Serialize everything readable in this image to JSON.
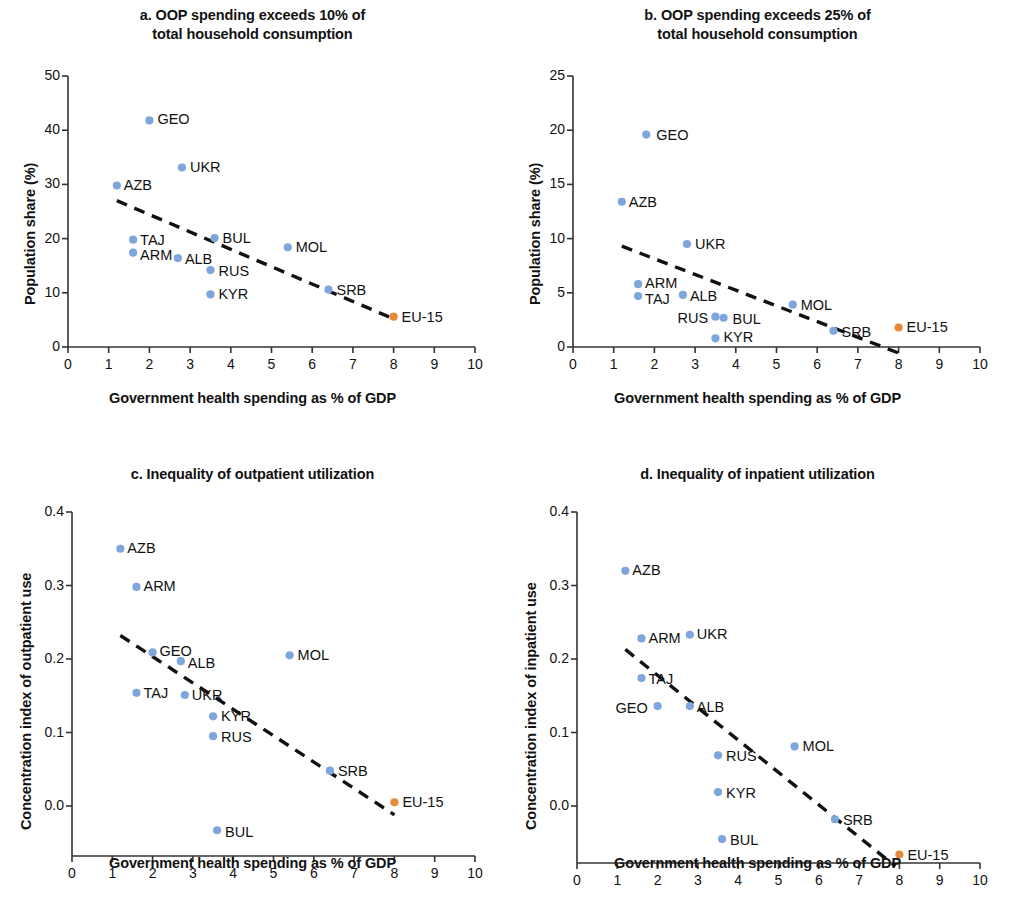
{
  "figure": {
    "axis_label_x": "Government health spending as % of GDP",
    "dot_color_blue": "#7FA6DC",
    "dot_color_orange": "#E8883A",
    "trend_color": "#111111"
  },
  "chart_data": [
    {
      "id": "a",
      "type": "scatter",
      "title_line1": "a. OOP spending exceeds 10% of",
      "title_line2": "total household consumption",
      "xlabel": "Government health spending as % of GDP",
      "ylabel": "Population share (%)",
      "xlim": [
        0,
        10
      ],
      "ylim": [
        0,
        50
      ],
      "xticks": [
        0,
        1,
        2,
        3,
        4,
        5,
        6,
        7,
        8,
        9,
        10
      ],
      "yticks": [
        0,
        10,
        20,
        30,
        40,
        50
      ],
      "grid": false,
      "legend": "none",
      "trendline": {
        "x0": 1.2,
        "y0": 27.0,
        "x1": 8.0,
        "y1": 5.2
      },
      "points": [
        {
          "label": "GEO",
          "x": 2.0,
          "y": 41.8,
          "color": "blue",
          "lx": 8,
          "ly": -8
        },
        {
          "label": "UKR",
          "x": 2.8,
          "y": 33.1,
          "color": "blue",
          "lx": 8,
          "ly": -8
        },
        {
          "label": "AZB",
          "x": 1.2,
          "y": 29.8,
          "color": "blue",
          "lx": 7,
          "ly": -7
        },
        {
          "label": "TAJ",
          "x": 1.6,
          "y": 19.8,
          "color": "blue",
          "lx": 7,
          "ly": -7
        },
        {
          "label": "ARM",
          "x": 1.6,
          "y": 17.4,
          "color": "blue",
          "lx": 7,
          "ly": -5
        },
        {
          "label": "ALB",
          "x": 2.7,
          "y": 16.4,
          "color": "blue",
          "lx": 7,
          "ly": -6
        },
        {
          "label": "BUL",
          "x": 3.6,
          "y": 20.1,
          "color": "blue",
          "lx": 8,
          "ly": -7
        },
        {
          "label": "RUS",
          "x": 3.5,
          "y": 14.2,
          "color": "blue",
          "lx": 8,
          "ly": -6
        },
        {
          "label": "KYR",
          "x": 3.5,
          "y": 9.7,
          "color": "blue",
          "lx": 8,
          "ly": -7
        },
        {
          "label": "MOL",
          "x": 5.4,
          "y": 18.4,
          "color": "blue",
          "lx": 8,
          "ly": -7
        },
        {
          "label": "SRB",
          "x": 6.4,
          "y": 10.6,
          "color": "blue",
          "lx": 8,
          "ly": -7
        },
        {
          "label": "EU-15",
          "x": 8.0,
          "y": 5.6,
          "color": "orange",
          "lx": 8,
          "ly": -7
        }
      ]
    },
    {
      "id": "b",
      "type": "scatter",
      "title_line1": "b. OOP spending exceeds 25% of",
      "title_line2": "total household consumption",
      "xlabel": "Government health spending as % of GDP",
      "ylabel": "Population share (%)",
      "xlim": [
        0,
        10
      ],
      "ylim": [
        0,
        25
      ],
      "xticks": [
        0,
        1,
        2,
        3,
        4,
        5,
        6,
        7,
        8,
        9,
        10
      ],
      "yticks": [
        0,
        5,
        10,
        15,
        20,
        25
      ],
      "grid": false,
      "legend": "none",
      "trendline": {
        "x0": 1.2,
        "y0": 9.3,
        "x1": 8.1,
        "y1": -0.7
      },
      "points": [
        {
          "label": "GEO",
          "x": 1.8,
          "y": 19.6,
          "color": "blue",
          "lx": 10,
          "ly": -7
        },
        {
          "label": "AZB",
          "x": 1.2,
          "y": 13.4,
          "color": "blue",
          "lx": 7,
          "ly": -7
        },
        {
          "label": "UKR",
          "x": 2.8,
          "y": 9.5,
          "color": "blue",
          "lx": 8,
          "ly": -7
        },
        {
          "label": "ARM",
          "x": 1.6,
          "y": 5.8,
          "color": "blue",
          "lx": 7,
          "ly": -8
        },
        {
          "label": "TAJ",
          "x": 1.6,
          "y": 4.7,
          "color": "blue",
          "lx": 7,
          "ly": -4
        },
        {
          "label": "ALB",
          "x": 2.7,
          "y": 4.8,
          "color": "blue",
          "lx": 7,
          "ly": -6
        },
        {
          "label": "RUS",
          "x": 3.5,
          "y": 2.8,
          "color": "blue",
          "lx": -38,
          "ly": -6
        },
        {
          "label": "BUL",
          "x": 3.7,
          "y": 2.7,
          "color": "blue",
          "lx": 9,
          "ly": -6
        },
        {
          "label": "KYR",
          "x": 3.5,
          "y": 0.8,
          "color": "blue",
          "lx": 8,
          "ly": -8
        },
        {
          "label": "MOL",
          "x": 5.4,
          "y": 3.9,
          "color": "blue",
          "lx": 8,
          "ly": -7
        },
        {
          "label": "SRB",
          "x": 6.4,
          "y": 1.5,
          "color": "blue",
          "lx": 8,
          "ly": -6
        },
        {
          "label": "EU-15",
          "x": 8.0,
          "y": 1.8,
          "color": "orange",
          "lx": 8,
          "ly": -7
        }
      ]
    },
    {
      "id": "c",
      "type": "scatter",
      "title_line1": "c. Inequality of outpatient utilization",
      "title_line2": "",
      "xlabel": "Government health spending as % of GDP",
      "ylabel": "Concentration index of outpatient use",
      "xlim": [
        0,
        10
      ],
      "ylim": [
        -0.05,
        0.4
      ],
      "xticks": [
        0,
        1,
        2,
        3,
        4,
        5,
        6,
        7,
        8,
        9,
        10
      ],
      "yticks": [
        "0.0",
        "0.1",
        "0.2",
        "0.3",
        "0.4"
      ],
      "ytickvals": [
        0.0,
        0.1,
        0.2,
        0.3,
        0.4
      ],
      "grid": false,
      "legend": "none",
      "trendline": {
        "x0": 1.2,
        "y0": 0.232,
        "x1": 8.0,
        "y1": -0.012
      },
      "points": [
        {
          "label": "AZB",
          "x": 1.2,
          "y": 0.35,
          "color": "blue",
          "lx": 7,
          "ly": -8
        },
        {
          "label": "ARM",
          "x": 1.6,
          "y": 0.298,
          "color": "blue",
          "lx": 7,
          "ly": -8
        },
        {
          "label": "GEO",
          "x": 2.0,
          "y": 0.209,
          "color": "blue",
          "lx": 7,
          "ly": -8
        },
        {
          "label": "ALB",
          "x": 2.7,
          "y": 0.197,
          "color": "blue",
          "lx": 7,
          "ly": -5
        },
        {
          "label": "TAJ",
          "x": 1.6,
          "y": 0.154,
          "color": "blue",
          "lx": 7,
          "ly": -7
        },
        {
          "label": "UKR",
          "x": 2.8,
          "y": 0.151,
          "color": "blue",
          "lx": 7,
          "ly": -7
        },
        {
          "label": "KYR",
          "x": 3.5,
          "y": 0.122,
          "color": "blue",
          "lx": 8,
          "ly": -7
        },
        {
          "label": "RUS",
          "x": 3.5,
          "y": 0.095,
          "color": "blue",
          "lx": 8,
          "ly": -6
        },
        {
          "label": "MOL",
          "x": 5.4,
          "y": 0.205,
          "color": "blue",
          "lx": 8,
          "ly": -7
        },
        {
          "label": "SRB",
          "x": 6.4,
          "y": 0.048,
          "color": "blue",
          "lx": 8,
          "ly": -7
        },
        {
          "label": "EU-15",
          "x": 8.0,
          "y": 0.005,
          "color": "orange",
          "lx": 8,
          "ly": -7
        },
        {
          "label": "BUL",
          "x": 3.6,
          "y": -0.033,
          "color": "blue",
          "lx": 8,
          "ly": -5
        }
      ]
    },
    {
      "id": "d",
      "type": "scatter",
      "title_line1": "d. Inequality of inpatient utilization",
      "title_line2": "",
      "xlabel": "Government health spending as % of GDP",
      "ylabel": "Concentration index of inpatient use",
      "xlim": [
        0,
        10
      ],
      "ylim": [
        -0.09,
        0.4
      ],
      "xticks": [
        0,
        1,
        2,
        3,
        4,
        5,
        6,
        7,
        8,
        9,
        10
      ],
      "yticks": [
        "0.0",
        "0.1",
        "0.2",
        "0.3",
        "0.4"
      ],
      "ytickvals": [
        0.0,
        0.1,
        0.2,
        0.3,
        0.4
      ],
      "grid": false,
      "legend": "none",
      "trendline": {
        "x0": 1.2,
        "y0": 0.213,
        "x1": 7.9,
        "y1": -0.082
      },
      "points": [
        {
          "label": "AZB",
          "x": 1.2,
          "y": 0.32,
          "color": "blue",
          "lx": 7,
          "ly": -8
        },
        {
          "label": "ARM",
          "x": 1.6,
          "y": 0.228,
          "color": "blue",
          "lx": 7,
          "ly": -7
        },
        {
          "label": "UKR",
          "x": 2.8,
          "y": 0.233,
          "color": "blue",
          "lx": 7,
          "ly": -8
        },
        {
          "label": "TAJ",
          "x": 1.6,
          "y": 0.174,
          "color": "blue",
          "lx": 7,
          "ly": -6
        },
        {
          "label": "GEO",
          "x": 2.0,
          "y": 0.136,
          "color": "blue",
          "lx": -42,
          "ly": -5
        },
        {
          "label": "ALB",
          "x": 2.8,
          "y": 0.136,
          "color": "blue",
          "lx": 7,
          "ly": -6
        },
        {
          "label": "RUS",
          "x": 3.5,
          "y": 0.069,
          "color": "blue",
          "lx": 8,
          "ly": -6
        },
        {
          "label": "KYR",
          "x": 3.5,
          "y": 0.019,
          "color": "blue",
          "lx": 8,
          "ly": -6
        },
        {
          "label": "MOL",
          "x": 5.4,
          "y": 0.081,
          "color": "blue",
          "lx": 8,
          "ly": -7
        },
        {
          "label": "SRB",
          "x": 6.4,
          "y": -0.018,
          "color": "blue",
          "lx": 8,
          "ly": -6
        },
        {
          "label": "BUL",
          "x": 3.6,
          "y": -0.045,
          "color": "blue",
          "lx": 8,
          "ly": -6
        },
        {
          "label": "EU-15",
          "x": 8.0,
          "y": -0.066,
          "color": "orange",
          "lx": 8,
          "ly": -7
        }
      ]
    }
  ]
}
